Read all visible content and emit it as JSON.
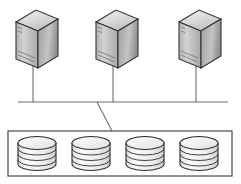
{
  "diagram": {
    "title": "Shared Storage Architecture",
    "type": "network-storage-topology",
    "canvas": {
      "width": 241,
      "height": 184,
      "background": "#ffffff"
    },
    "palette": {
      "outline": "#333333",
      "line": "#6e6e6e",
      "box_outline": "#4a4a4a",
      "disk_outline": "#2e2e2e",
      "fill_light": "#e8e8e8",
      "fill_mid": "#c9c9c9",
      "fill_dark": "#9a9a9a",
      "background": "#ffffff"
    },
    "servers": {
      "count": 3,
      "icon_name": "server-tower-icon",
      "items": [
        {
          "id": "server-1",
          "label": "",
          "x": 16,
          "y": 10
        },
        {
          "id": "server-2",
          "label": "",
          "x": 88,
          "y": 10
        },
        {
          "id": "server-3",
          "label": "",
          "x": 165,
          "y": 10
        }
      ]
    },
    "bus": {
      "id": "network-bus",
      "label": "",
      "x1": 18,
      "y1": 102,
      "x2": 228,
      "y2": 102
    },
    "drop_links": {
      "count": 3,
      "items": [
        {
          "id": "link-server-1",
          "x": 33,
          "y1": 68,
          "y2": 102
        },
        {
          "id": "link-server-2",
          "x": 113,
          "y1": 68,
          "y2": 102
        },
        {
          "id": "link-server-3",
          "x": 196,
          "y1": 68,
          "y2": 102
        }
      ]
    },
    "storage_link": {
      "id": "bus-to-storage-link",
      "label": "",
      "x1": 97,
      "y1": 102,
      "x2": 112,
      "y2": 131
    },
    "storage_array": {
      "id": "storage-array",
      "label": "",
      "x": 8,
      "y": 131,
      "width": 224,
      "height": 45,
      "disks": {
        "count": 4,
        "icon_name": "disk-cylinder-icon",
        "band_count": 3,
        "items": [
          {
            "id": "disk-1",
            "label": "",
            "cx": 37
          },
          {
            "id": "disk-2",
            "label": "",
            "cx": 91
          },
          {
            "id": "disk-3",
            "label": "",
            "cx": 145
          },
          {
            "id": "disk-4",
            "label": "",
            "cx": 199
          }
        ]
      }
    }
  }
}
